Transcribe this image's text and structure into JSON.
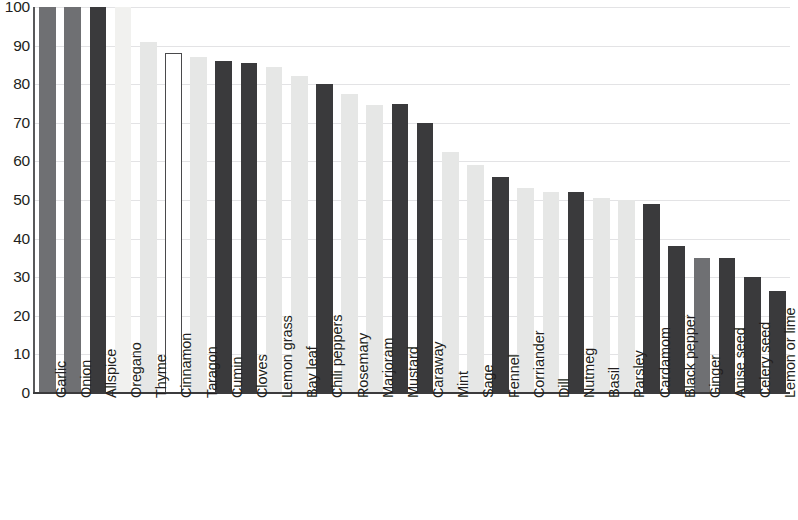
{
  "chart_data": {
    "type": "bar",
    "title": "",
    "subtitle": "",
    "xlabel": "",
    "ylabel": "",
    "ylim": [
      0,
      100
    ],
    "xlim_note": "categorical",
    "grid": true,
    "legend": "none",
    "y_ticks": [
      0,
      10,
      20,
      30,
      40,
      50,
      60,
      70,
      80,
      90,
      100
    ],
    "y_tick_labels": [
      "0",
      "10",
      "20",
      "30",
      "40",
      "50",
      "60",
      "70",
      "80",
      "90",
      "100"
    ],
    "categories": [
      "Garlic",
      "Onion",
      "Allspice",
      "Oregano",
      "Thyme",
      "Cinnamon",
      "Taragon",
      "Cumin",
      "Cloves",
      "Lemon grass",
      "Bay leaf",
      "Chili peppers",
      "Rosemary",
      "Marjoram",
      "Mustard",
      "Caraway",
      "Mint",
      "Sage",
      "Fennel",
      "Corriander",
      "Dill",
      "Nutmeg",
      "Basil",
      "Parsley",
      "Cardamom",
      "Black pepper",
      "Ginger",
      "Anise seed",
      "Celery seed",
      "Lemon or lime"
    ],
    "values": [
      100,
      100,
      100,
      100,
      91,
      88,
      87,
      86,
      85.5,
      84.5,
      82,
      80,
      77.5,
      74.5,
      75,
      70,
      62.5,
      59,
      56,
      53,
      52,
      52,
      50.5,
      50,
      49,
      38,
      35,
      35,
      30,
      26.5
    ],
    "bar_styles": [
      "sh-mid",
      "sh-mid",
      "sh-dark",
      "sh-pale",
      "sh-light",
      "sh-open",
      "sh-light",
      "sh-dark",
      "sh-dark",
      "sh-light",
      "sh-light",
      "sh-dark",
      "sh-light",
      "sh-light",
      "sh-dark",
      "sh-dark",
      "sh-light",
      "sh-light",
      "sh-dark",
      "sh-light",
      "sh-light",
      "sh-dark",
      "sh-light",
      "sh-light",
      "sh-dark",
      "sh-dark",
      "sh-mid",
      "sh-dark",
      "sh-dark",
      "sh-dark"
    ],
    "colors": {
      "dark": "#3a3a3c",
      "mid": "#6f7073",
      "light": "#e6e7e6",
      "pale": "#f1f1ef",
      "open_fill": "#ffffff",
      "open_stroke": "#4a4a4c",
      "gridline": "#e3e3e5",
      "axis": "#3b3b3d",
      "text": "#231f20"
    }
  }
}
